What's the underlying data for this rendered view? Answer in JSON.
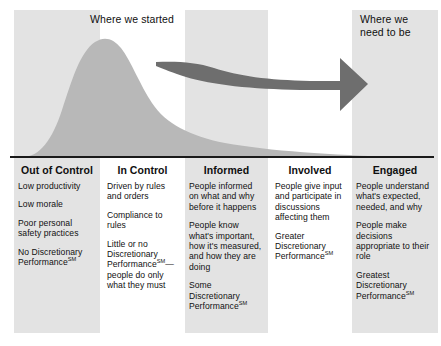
{
  "diagram": {
    "title_top_left": "Where we started",
    "title_top_right": "Where we\nneed to be",
    "colors": {
      "band": "#e3e3e3",
      "curve": "#b8b8b8",
      "arrow": "#6e6e6e",
      "baseline": "#1a1a1a",
      "text": "#111111"
    },
    "arrow": {
      "label": "progress-arrow",
      "direction": "left-to-right",
      "from_stage": "In Control",
      "to_stage": "Engaged"
    },
    "curve": {
      "label": "declining-curve",
      "peak_stage": "Out of Control",
      "shape": "skewed-bell-decay"
    }
  },
  "stages": [
    {
      "id": "out-of-control",
      "title": "Out of Control",
      "shaded": true,
      "items": [
        {
          "text": "Low productivity",
          "sm": false
        },
        {
          "text": "Low morale",
          "sm": false
        },
        {
          "text": "Poor personal safety practices",
          "sm": false
        },
        {
          "text": "No Discretionary Performance",
          "sm": true
        }
      ]
    },
    {
      "id": "in-control",
      "title": "In Control",
      "shaded": false,
      "items": [
        {
          "text": "Driven by rules and orders",
          "sm": false
        },
        {
          "text": "Compliance to rules",
          "sm": false
        },
        {
          "text": "Little or no Discretionary Performance",
          "sm": true,
          "after_sm": "—people do only what they must"
        }
      ]
    },
    {
      "id": "informed",
      "title": "Informed",
      "shaded": true,
      "items": [
        {
          "text": "People informed on what and why before it happens",
          "sm": false
        },
        {
          "text": "People know what's important, how it's measured, and how they are doing",
          "sm": false
        },
        {
          "text": "Some Discretionary Performance",
          "sm": true
        }
      ]
    },
    {
      "id": "involved",
      "title": "Involved",
      "shaded": false,
      "items": [
        {
          "text": "People give input and participate in discussions affecting them",
          "sm": false
        },
        {
          "text": "Greater Discretionary Performance",
          "sm": true
        }
      ]
    },
    {
      "id": "engaged",
      "title": "Engaged",
      "shaded": true,
      "items": [
        {
          "text": "People understand what's expected, needed, and why",
          "sm": false
        },
        {
          "text": "People make decisions appropriate to their role",
          "sm": false
        },
        {
          "text": "Greatest Discretionary Performance",
          "sm": true
        }
      ]
    }
  ],
  "sm_mark": "SM"
}
